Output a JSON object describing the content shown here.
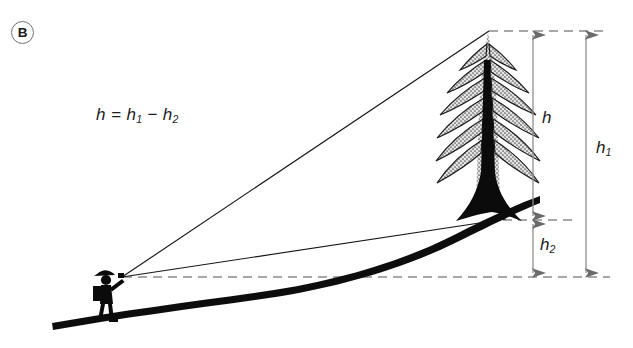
{
  "figure": {
    "panel_label": "B",
    "formula": {
      "lhs": "h",
      "eq": "=",
      "term1": "h",
      "term1_sub": "1",
      "minus": "−",
      "term2": "h",
      "term2_sub": "2",
      "plain": "h = h1 − h2"
    },
    "dimensions": [
      {
        "id": "h",
        "symbol": "h",
        "subscript": "",
        "meaning": "tree height above base"
      },
      {
        "id": "h1",
        "symbol": "h",
        "subscript": "1",
        "meaning": "height of treetop above instrument level"
      },
      {
        "id": "h2",
        "symbol": "h",
        "subscript": "2",
        "meaning": "height of instrument level above tree base"
      }
    ],
    "elements": {
      "observer": "hiker-with-backpack-and-clinometer",
      "tree": "stippled-conifer",
      "ground": "sloping-hillside-profile",
      "sight_line_top": "line-of-sight-to-treetop",
      "sight_line_base": "line-of-sight-to-tree-base",
      "reference_line": "horizontal-instrument-level"
    },
    "colors": {
      "ink": "#111111",
      "dimension_line": "#8e8e8e",
      "dashed_line": "#8a8a8a",
      "crown_fill": "#d9d9d9",
      "background": "#ffffff"
    }
  }
}
